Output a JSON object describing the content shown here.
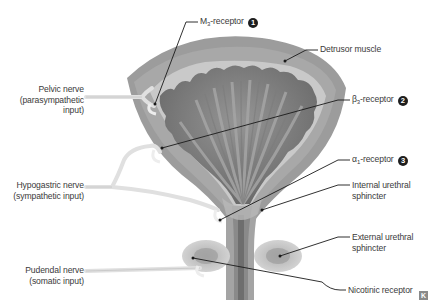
{
  "diagram": {
    "colors": {
      "detrusor_outer": "#9a9a9a",
      "detrusor_inner": "#a9a9a9",
      "submucosa": "#c8c8c8",
      "mucosa_dark": "#6e6e6e",
      "mucosa_folds": "#8c8c8c",
      "nerve": "#e2e2e2",
      "urethra_lumen": "#7a7a7a",
      "sphincter": "#b5b5b5",
      "leader_line": "#1a1a1a",
      "text": "#3a3a3a",
      "badge": "#1e1e1e"
    },
    "left_labels": {
      "pelvic_nerve": {
        "line1": "Pelvic nerve",
        "line2": "(parasympathetic",
        "line3": "input)"
      },
      "hypogastric_nerve": {
        "line1": "Hypogastric nerve",
        "line2": "(sympathetic input)"
      },
      "pudendal_nerve": {
        "line1": "Pudendal nerve",
        "line2": "(somatic input)"
      }
    },
    "right_labels": {
      "m3_receptor": {
        "prefix": "M",
        "subscript": "3",
        "suffix": "-receptor",
        "badge": "1"
      },
      "detrusor_muscle": {
        "text": "Detrusor muscle"
      },
      "beta3_receptor": {
        "prefix": "β",
        "subscript": "3",
        "suffix": "-receptor",
        "badge": "2"
      },
      "alpha1_receptor": {
        "prefix": "α",
        "subscript": "1",
        "suffix": "-receptor",
        "badge": "3"
      },
      "internal_sphincter": {
        "line1": "Internal urethral",
        "line2": "sphincter"
      },
      "external_sphincter": {
        "line1": "External urethral",
        "line2": "sphincter"
      },
      "nicotinic_receptor": {
        "text": "Nicotinic receptor"
      }
    },
    "logo": {
      "glyph": "K"
    }
  }
}
